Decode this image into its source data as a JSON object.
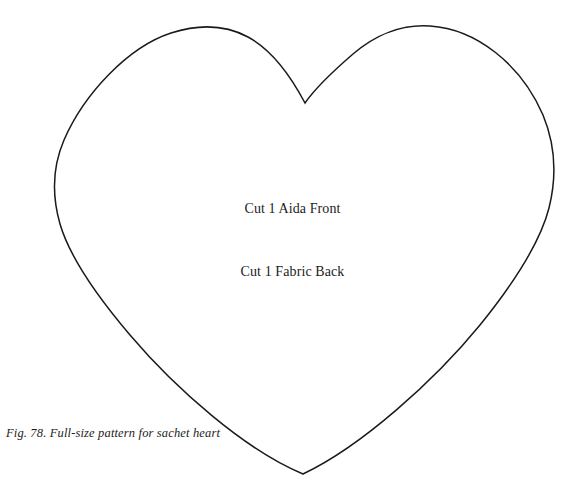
{
  "page": {
    "background_color": "#ffffff",
    "width": 585,
    "height": 502
  },
  "figure": {
    "caption": "Fig. 78. Full-size pattern for sachet heart",
    "shape_name": "heart-pattern-outline",
    "stroke_color": "#1a1a1a",
    "stroke_width": 1.5,
    "fill_color": "none"
  },
  "labels": {
    "front": "Cut 1 Aida Front",
    "back": "Cut 1 Fabric Back"
  },
  "geometry": {
    "left_lobe_peak": "185,29",
    "right_lobe_peak": "425,30",
    "top_cleft": "305,103",
    "left_extreme": "55,170",
    "right_extreme": "556,155",
    "bottom_point": "303,474"
  }
}
